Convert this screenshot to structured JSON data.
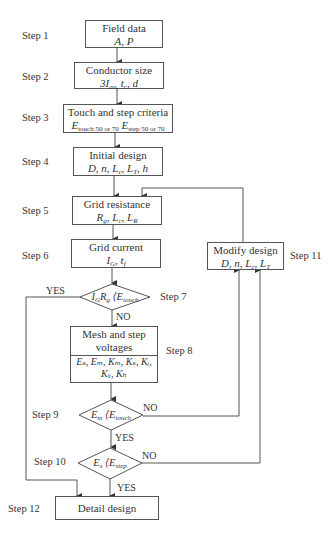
{
  "steps": {
    "s1": "Step 1",
    "s2": "Step 2",
    "s3": "Step 3",
    "s4": "Step 4",
    "s5": "Step 5",
    "s6": "Step 6",
    "s7": "Step 7",
    "s8": "Step 8",
    "s9": "Step 9",
    "s10": "Step 10",
    "s11": "Step 11",
    "s12": "Step 12"
  },
  "boxes": {
    "field_data": {
      "title": "Field data",
      "vars": "A, P"
    },
    "conductor_size": {
      "title": "Conductor size",
      "vars_prefix": "3I",
      "vars_sub": "ao,",
      "vars_rest": " t",
      "vars_sub2": "c",
      "vars_end": ", d"
    },
    "touch_step": {
      "title": "Touch and step criteria",
      "e1": "E",
      "e1_sub": "touch 50 or 70",
      "e2": " E",
      "e2_sub": "step 50 or 70"
    },
    "initial_design": {
      "title": "Initial design",
      "vars": "D, n, L",
      "sub_c": "c",
      "mid": ", L",
      "sub_t": "T",
      "end": ", h"
    },
    "grid_resistance": {
      "title": "Grid resistance",
      "r": "R",
      "r_sub": "g",
      "l": ", L",
      "l_sub": "c",
      "l2": ", L",
      "l2_sub": "R"
    },
    "grid_current": {
      "title": "Grid current",
      "i": "I",
      "i_sub": "G",
      "t": ", t",
      "t_sub": "f"
    },
    "mesh_step": {
      "title_line1": "Mesh and step",
      "title_line2": "voltages",
      "vars_line1": "Eₛ, Eₘ, Kₘ, Kₛ, Kᵢ,",
      "vars_line2": "Kᵢᵢ, Kₕ"
    },
    "modify_design": {
      "title": "Modify design",
      "vars": "D, n, L",
      "sub_c": "c",
      "mid": ", L",
      "sub_t": "T"
    },
    "detail_design": {
      "title": "Detail design"
    }
  },
  "decisions": {
    "d7": {
      "text": "I",
      "sub1": "G",
      "mid": "R",
      "sub2": "g",
      "op": " ⟨E",
      "sub3": "touch"
    },
    "d9": {
      "text": "E",
      "sub1": "m",
      "op": " ⟨E",
      "sub2": "touch"
    },
    "d10": {
      "text": "E",
      "sub1": "s",
      "op": " ⟨E",
      "sub2": "step"
    }
  },
  "labels": {
    "yes7": "YES",
    "no7": "NO",
    "no9": "NO",
    "yes9": "YES",
    "no10": "NO",
    "yes10": "YES"
  }
}
